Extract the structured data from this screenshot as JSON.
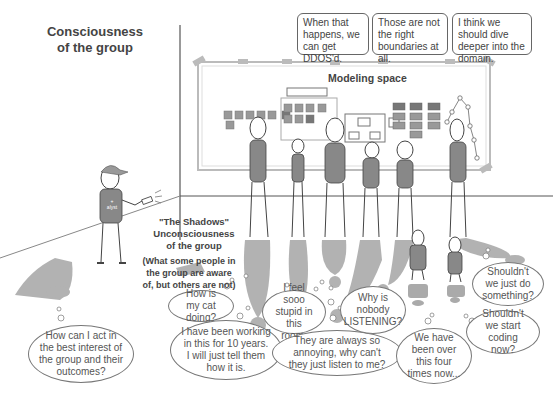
{
  "title": {
    "line1": "Consciousness",
    "line2": "of the group"
  },
  "modeling_space": {
    "label": "Modeling space"
  },
  "shadows": {
    "line1": "\"The Shadows\"",
    "line2": "Unconsciousness",
    "line3": "of the group",
    "note1": "(What some people in",
    "note2": "the group are aware",
    "note3": "of, but others are not)"
  },
  "analyst": {
    "shirt_text1": "+",
    "shirt_text2": "alyst"
  },
  "speech_bubbles": [
    {
      "text": "When that happens, we can get DDOS'd."
    },
    {
      "text": "Those are not the right boundaries at all."
    },
    {
      "text": "I think we should dive deeper into the domain."
    }
  ],
  "thought_bubbles": [
    {
      "text": "How can I act in the best interest of the group and their outcomes?"
    },
    {
      "text": "How is my cat doing?"
    },
    {
      "text": "I have been working in this for 10 years. I will just tell them how it is."
    },
    {
      "text": "I feel sooo stupid in this room."
    },
    {
      "text": "They are always so annoying, why can't they just listen to me?"
    },
    {
      "text": "Why is nobody LISTENING?"
    },
    {
      "text": "We have been over this four times now..."
    },
    {
      "text": "Shouldn't we just do something?"
    },
    {
      "text": "Shouldn't we start coding now?"
    }
  ]
}
